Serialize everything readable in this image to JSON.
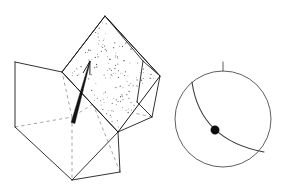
{
  "figure": {
    "background_color": "#ffffff",
    "line_color": "#1c1c1c",
    "hidden_line_color": "#8d8d8d",
    "width": 287,
    "height": 196
  },
  "block_diagram": {
    "name": "fault-block-diagram",
    "description": "Transparent rectangular block cut by an inclined fault plane",
    "fault_plane": {
      "label": "fault-plane",
      "ornament": "stipple",
      "fill_color": "#ffffff",
      "stipple_color": "#4a4a4a",
      "stipple_count": 150,
      "polygon": [
        [
          62,
          72
        ],
        [
          105,
          16
        ],
        [
          160,
          76
        ],
        [
          118,
          132
        ]
      ]
    },
    "slip_vector": {
      "label": "slip-vector-arrow",
      "color": "#111111",
      "tail": [
        73,
        123
      ],
      "tip": [
        90,
        61
      ],
      "head_half_width": 3.4,
      "head_length": 13
    },
    "solid_edges": [
      [
        [
          15,
          62
        ],
        [
          62,
          72
        ]
      ],
      [
        [
          15,
          62
        ],
        [
          15,
          127
        ]
      ],
      [
        [
          15,
          127
        ],
        [
          72,
          180
        ]
      ],
      [
        [
          72,
          180
        ],
        [
          120,
          172
        ]
      ],
      [
        [
          120,
          172
        ],
        [
          118,
          132
        ]
      ],
      [
        [
          62,
          72
        ],
        [
          118,
          132
        ]
      ],
      [
        [
          105,
          16
        ],
        [
          160,
          76
        ]
      ],
      [
        [
          160,
          76
        ],
        [
          152,
          117
        ]
      ],
      [
        [
          152,
          117
        ],
        [
          118,
          132
        ]
      ],
      [
        [
          105,
          16
        ],
        [
          62,
          72
        ]
      ],
      [
        [
          118,
          132
        ],
        [
          72,
          180
        ]
      ],
      [
        [
          160,
          76
        ],
        [
          143,
          61
        ]
      ],
      [
        [
          143,
          61
        ],
        [
          105,
          16
        ]
      ],
      [
        [
          152,
          117
        ],
        [
          137,
          102
        ]
      ],
      [
        [
          137,
          102
        ],
        [
          143,
          61
        ]
      ]
    ],
    "hidden_edges": [
      [
        [
          15,
          127
        ],
        [
          72,
          117
        ]
      ],
      [
        [
          72,
          117
        ],
        [
          72,
          180
        ]
      ],
      [
        [
          72,
          117
        ],
        [
          62,
          72
        ]
      ],
      [
        [
          152,
          117
        ],
        [
          93,
          104
        ]
      ],
      [
        [
          93,
          104
        ],
        [
          72,
          117
        ]
      ],
      [
        [
          93,
          104
        ],
        [
          105,
          16
        ]
      ],
      [
        [
          137,
          102
        ],
        [
          93,
          104
        ]
      ],
      [
        [
          120,
          172
        ],
        [
          93,
          104
        ]
      ]
    ]
  },
  "stereonet": {
    "name": "stereonet",
    "description": "Lower-hemisphere equal-area projection of the fault plane and its slip lineation",
    "primitive_circle": {
      "center": [
        223,
        119
      ],
      "radius": 48,
      "color": "#4d4d4d"
    },
    "north_tick": {
      "label": "north-tick",
      "from": [
        223,
        71
      ],
      "to": [
        223,
        62
      ],
      "color": "#4d4d4d"
    },
    "great_circle": {
      "label": "fault-plane-great-circle",
      "color": "#3a3a3a",
      "start": [
        192,
        82
      ],
      "end": [
        264,
        152
      ],
      "control": [
        200,
        140
      ]
    },
    "lineation": {
      "label": "slip-lineation-point",
      "center": [
        215,
        130
      ],
      "radius": 4.2,
      "color": "#0d0d0d"
    }
  },
  "accessibility": {
    "summary": "Left: an isometric line-drawing block diagram of rock cut by an inclined, stippled fault plane bearing a slip-direction arrow. Right: a circular stereonet plot with a north tick mark, a great-circle arc representing the fault plane, and a filled dot on the arc marking the slip lineation."
  }
}
